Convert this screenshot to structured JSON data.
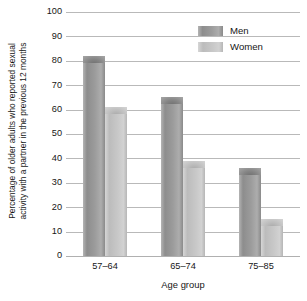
{
  "chart_data": {
    "type": "bar",
    "title": "",
    "categories": [
      "57–64",
      "65–74",
      "75–85"
    ],
    "series": [
      {
        "name": "Men",
        "values": [
          82,
          65,
          36
        ],
        "color": "#9c9c9c"
      },
      {
        "name": "Women",
        "values": [
          61,
          39,
          15
        ],
        "color": "#c8c8c8"
      }
    ],
    "xlabel": "Age group",
    "ylabel": "Percentage of older adults who reported sexual activity with a partner in the previous 12 months",
    "ylabel_lines": [
      "Percentage of older adults who reported sexual",
      "activity with a partner in the previous 12 months"
    ],
    "ylim": [
      0,
      100
    ],
    "yticks": [
      100,
      90,
      80,
      70,
      60,
      50,
      40,
      30,
      20,
      10,
      0
    ],
    "ytick_labels": [
      "100",
      "90",
      "80",
      "70",
      "60",
      "50",
      "40",
      "30",
      "20",
      "10",
      "0"
    ],
    "grid": true,
    "legend_position": "top-right",
    "legend": [
      "Men",
      "Women"
    ]
  }
}
